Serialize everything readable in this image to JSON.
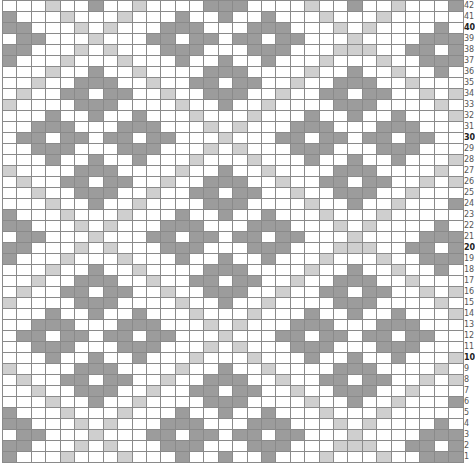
{
  "chart": {
    "columns": 32,
    "rows": 42,
    "legend": {
      "D": {
        "name": "dark-stitch",
        "color": "#9c9c9c"
      },
      "L": {
        "name": "light-stitch",
        "color": "#cfcfcf"
      },
      ".": {
        "name": "background-stitch",
        "color": "#ffffff"
      }
    },
    "bold_row_labels": [
      40,
      30,
      20,
      10
    ],
    "grid_top_to_bottom": [
      {
        "row": 42,
        "cells": "...L..D..L....DDD....L..D..L...D"
      },
      {
        "row": 41,
        "cells": "D...L...L...D..D..D...L...L....."
      },
      {
        "row": 40,
        "cells": "DD...L.L...DDD...DDD...L.L....D."
      },
      {
        "row": 39,
        "cells": ".DD...L...DD.DD.DD.DD...L....DDD"
      },
      {
        "row": 38,
        "cells": "DD...L.L...DDD...DDD...LLL..DD.D"
      },
      {
        "row": 37,
        "cells": "D...L...L...D..D..D...L...L..DDD"
      },
      {
        "row": 36,
        "cells": "...L..D..L....DDD....L..D..L..D."
      },
      {
        "row": 35,
        "cells": "..L..DDD..L..DD.DD..L..DDD..L..."
      },
      {
        "row": 34,
        "cells": ".L..DD.DD..L..DDD..L..DD.DD..L.L"
      },
      {
        "row": 33,
        "cells": "L....DDD....L..D..L....DDD....L."
      },
      {
        "row": 32,
        "cells": "...D..D..D...L...L...D..D..D...L"
      },
      {
        "row": 31,
        "cells": "..DDD...DDD...L.L...DDD...DDD..."
      },
      {
        "row": 30,
        "cells": ".DD.DD.DD.DD...L...DD.DD.DD.DD.."
      },
      {
        "row": 29,
        "cells": "..DDD...DDD...L.L...DDD...DDD..."
      },
      {
        "row": 28,
        "cells": "...D..D..D...L...L...D..D..D...L"
      },
      {
        "row": 27,
        "cells": "L....DDD....L..D..L....DDD....L."
      },
      {
        "row": 26,
        "cells": ".L..DD.DD..L..DDD..L..DD.DD..L.L"
      },
      {
        "row": 25,
        "cells": "..L..DDD..L..DD.DD..L..DDD..L..."
      },
      {
        "row": 24,
        "cells": "...L..D..L....DDD....L..D..L...D"
      },
      {
        "row": 23,
        "cells": "D...L...L...D..D..D...L...L....."
      },
      {
        "row": 22,
        "cells": "DD...L.L...DDD...DDD...L.L....D."
      },
      {
        "row": 21,
        "cells": ".DD...L...DD.DD.DD.DD...L....DDD"
      },
      {
        "row": 20,
        "cells": "DD...L.L...DDD...DDD...LLL..DD.D"
      },
      {
        "row": 19,
        "cells": "D...L...L...D..D..D...L...L..DDD"
      },
      {
        "row": 18,
        "cells": "...L..D..L....DDD....L..D..L..D."
      },
      {
        "row": 17,
        "cells": "..L..DDD..L..DD.DD..L..DDD..L..."
      },
      {
        "row": 16,
        "cells": ".L..DD.DD..L..DDD..L..DD.DD..L.L"
      },
      {
        "row": 15,
        "cells": "L....DDD....L..D..L....DDD....L."
      },
      {
        "row": 14,
        "cells": "...D..D..D...L...L...D..D..D...L"
      },
      {
        "row": 13,
        "cells": "..DDD...DDD...L.L...DDD...DDD..."
      },
      {
        "row": 12,
        "cells": ".DD.DD.DD.DD...L...DD.DD.DD.DD.."
      },
      {
        "row": 11,
        "cells": "..DDD...DDD...L.L...DDD...DDD..."
      },
      {
        "row": 10,
        "cells": "...D..D..D...L...L...D..D..D...L"
      },
      {
        "row": 9,
        "cells": "L....DDD....L..D..L....DDD....L."
      },
      {
        "row": 8,
        "cells": ".L..DD.DD..L..DDD..L..DD.DD..L.L"
      },
      {
        "row": 7,
        "cells": "..L..DDD..L..DD.DD..L..DDD..L..."
      },
      {
        "row": 6,
        "cells": "...L..D..L....DDD....L..D..L...D"
      },
      {
        "row": 5,
        "cells": "D...L...L...D..D..D...L...L....."
      },
      {
        "row": 4,
        "cells": "DD...L.L...DDD...DDD...L.L....D."
      },
      {
        "row": 3,
        "cells": ".DD...L...DD.DD.DD.DD...L....DDD"
      },
      {
        "row": 2,
        "cells": "DD...L.L...DDD...DDD...LLL..DD.D"
      },
      {
        "row": 1,
        "cells": "D...L...L...D..D..D...L...L..DDD"
      }
    ]
  }
}
